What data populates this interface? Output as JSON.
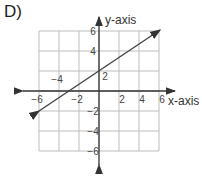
{
  "panel": {
    "label": "D)"
  },
  "colors": {
    "grid": "#bdbdbd",
    "axis": "#333333",
    "line": "#444444",
    "text": "#444444"
  },
  "chart_data": {
    "type": "line",
    "title": "",
    "xlabel": "x-axis",
    "ylabel": "y-axis",
    "xlim": [
      -6,
      6
    ],
    "ylim": [
      -6,
      6
    ],
    "grid": true,
    "grid_step": 2,
    "x_tick_labels": [
      {
        "value": -6,
        "text": "-6"
      },
      {
        "value": -4,
        "text": "-4"
      },
      {
        "value": -2,
        "text": "-2"
      },
      {
        "value": 2,
        "text": "2"
      },
      {
        "value": 4,
        "text": "4"
      },
      {
        "value": 6,
        "text": "6"
      }
    ],
    "y_tick_labels": [
      {
        "value": 6,
        "text": "6"
      },
      {
        "value": 4,
        "text": "4"
      },
      {
        "value": 2,
        "text": "2"
      },
      {
        "value": -2,
        "text": "-2"
      },
      {
        "value": -4,
        "text": "-4"
      },
      {
        "value": -6,
        "text": "-6"
      }
    ],
    "series": [
      {
        "name": "line",
        "equation": "y = (2/3)x + 2",
        "slope": 0.6667,
        "y_intercept": 2,
        "x_intercept": -3,
        "x": [
          -6,
          -3,
          0,
          3,
          6
        ],
        "y": [
          -2,
          0,
          2,
          4,
          6
        ],
        "arrows": "both"
      }
    ]
  }
}
